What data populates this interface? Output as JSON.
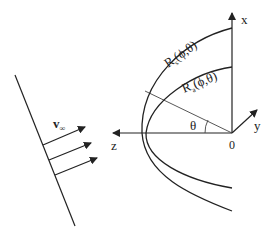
{
  "diagram": {
    "labels": {
      "x_axis": "x",
      "y_axis": "y",
      "z_axis": "z",
      "origin": "0",
      "angle": "θ",
      "velocity": "v",
      "velocity_sub": "∞",
      "outer_curve": "R",
      "outer_curve_sub": "s",
      "outer_curve_args": "(ϕ,θ)",
      "inner_curve": "R",
      "inner_curve_sub": "a",
      "inner_curve_args": "(ϕ,θ)"
    },
    "colors": {
      "line": "#222222",
      "background": "#ffffff"
    }
  }
}
